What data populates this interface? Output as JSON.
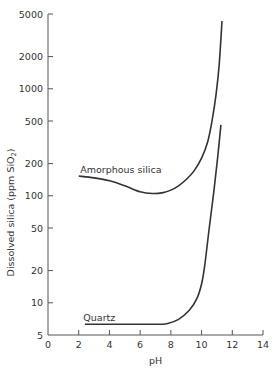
{
  "chart_data": {
    "type": "line",
    "title": "",
    "xlabel": "pH",
    "ylabel": "Dissolved silica (ppm SiO2)",
    "ylabel_parts": {
      "main": "Dissolved silica (ppm SiO",
      "sub": "2",
      "tail": ")"
    },
    "xlim": [
      0,
      14
    ],
    "ylim": [
      5,
      5000
    ],
    "yscale": "log",
    "grid": false,
    "legend": "none (inline labels)",
    "x_ticks": [
      0,
      2,
      4,
      6,
      8,
      10,
      12,
      14
    ],
    "y_ticks": [
      5,
      10,
      20,
      50,
      100,
      200,
      500,
      1000,
      2000,
      5000
    ],
    "series": [
      {
        "name": "Amorphous silica",
        "label_pos": {
          "x": 2.1,
          "y": 165
        },
        "points": [
          [
            2.0,
            153
          ],
          [
            3.0,
            147
          ],
          [
            4.0,
            138
          ],
          [
            5.0,
            124
          ],
          [
            6.0,
            109
          ],
          [
            6.8,
            105
          ],
          [
            7.5,
            107
          ],
          [
            8.0,
            113
          ],
          [
            8.5,
            124
          ],
          [
            9.0,
            142
          ],
          [
            9.5,
            170
          ],
          [
            10.0,
            225
          ],
          [
            10.4,
            320
          ],
          [
            10.7,
            520
          ],
          [
            10.95,
            900
          ],
          [
            11.15,
            1700
          ],
          [
            11.33,
            4300
          ]
        ]
      },
      {
        "name": "Quartz",
        "label_pos": {
          "x": 2.3,
          "y": 6.8
        },
        "points": [
          [
            2.4,
            6.3
          ],
          [
            4.0,
            6.3
          ],
          [
            6.0,
            6.3
          ],
          [
            7.3,
            6.3
          ],
          [
            7.8,
            6.4
          ],
          [
            8.5,
            7.0
          ],
          [
            9.2,
            8.5
          ],
          [
            9.7,
            11.0
          ],
          [
            10.0,
            15.0
          ],
          [
            10.2,
            22
          ],
          [
            10.5,
            50
          ],
          [
            10.8,
            110
          ],
          [
            11.05,
            230
          ],
          [
            11.26,
            460
          ]
        ]
      }
    ]
  }
}
